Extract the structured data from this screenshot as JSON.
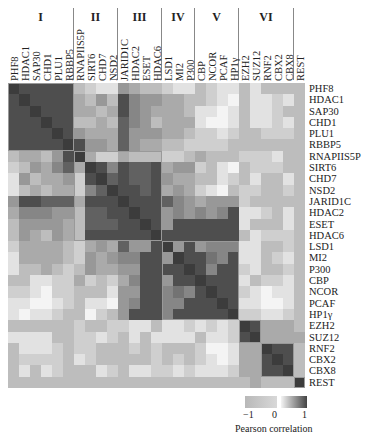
{
  "chart_data": {
    "type": "heatmap",
    "title": "",
    "colorbar_label": "Pearson correlation",
    "colorbar_ticks": [
      "−1",
      "0",
      "1"
    ],
    "colorscale": {
      "min": -1,
      "max": 1,
      "low_color": "#b8b8b8",
      "mid_color": "#f4f4f4",
      "high_color": "#3c3c3c"
    },
    "groups": [
      {
        "label": "I",
        "start": 0,
        "end": 5
      },
      {
        "label": "II",
        "start": 6,
        "end": 9
      },
      {
        "label": "III",
        "start": 10,
        "end": 13
      },
      {
        "label": "IV",
        "start": 14,
        "end": 16
      },
      {
        "label": "V",
        "start": 17,
        "end": 20
      },
      {
        "label": "VI",
        "start": 21,
        "end": 25
      }
    ],
    "labels": [
      "PHF8",
      "HDAC1",
      "SAP30",
      "CHD1",
      "PLU1",
      "RBBP5",
      "RNAPIIS5P",
      "SIRT6",
      "CHD7",
      "NSD2",
      "JARID1C",
      "HDAC2",
      "ESET",
      "HDAC6",
      "LSD1",
      "MI2",
      "P300",
      "CBP",
      "NCOR",
      "PCAF",
      "HP1γ",
      "EZH2",
      "SUZ12",
      "RNF2",
      "CBX2",
      "CBX8",
      "REST"
    ],
    "matrix": [
      [
        1,
        0.9,
        0.9,
        0.9,
        0.9,
        0.9,
        0.3,
        0.2,
        0.1,
        0.1,
        0.5,
        0.4,
        0.3,
        0.3,
        0.2,
        0.1,
        0.1,
        0.3,
        0.2,
        0.1,
        0.1,
        0.3,
        0.1,
        0.3,
        0.3,
        0.3,
        0.3
      ],
      [
        0.9,
        1,
        0.9,
        0.9,
        0.9,
        0.9,
        0.4,
        0.3,
        0.5,
        0.3,
        0.9,
        0.6,
        0.5,
        0.5,
        0.4,
        0.4,
        0.3,
        0.3,
        0.2,
        0.1,
        0,
        0.3,
        0.1,
        0.1,
        0.2,
        0.1,
        0.3
      ],
      [
        0.9,
        0.9,
        1,
        0.9,
        0.9,
        0.9,
        0.4,
        0.4,
        0.3,
        0.4,
        0.9,
        0.6,
        0.5,
        0.4,
        0.4,
        0.4,
        0.3,
        0.1,
        0.1,
        0,
        0.1,
        0.3,
        0.1,
        0.1,
        0.2,
        0.3,
        0.3
      ],
      [
        0.9,
        0.9,
        0.9,
        1,
        0.9,
        0.9,
        0.3,
        0.3,
        0.4,
        0.3,
        0.8,
        0.6,
        0.5,
        0.3,
        0.4,
        0.4,
        0.4,
        0.1,
        0,
        0,
        0.1,
        0.3,
        0.1,
        0.1,
        0.2,
        0.1,
        0.3
      ],
      [
        0.9,
        0.9,
        0.9,
        0.9,
        1,
        0.9,
        0.5,
        0.4,
        0.4,
        0.4,
        0.8,
        0.5,
        0.5,
        0.5,
        0.4,
        0.4,
        0.3,
        0.2,
        0.2,
        0.1,
        0.2,
        0.3,
        0.3,
        0.2,
        0.2,
        0.2,
        0.3
      ],
      [
        0.9,
        0.9,
        0.9,
        0.9,
        0.9,
        1,
        0.9,
        0.5,
        0.5,
        0.4,
        0.8,
        0.5,
        0.4,
        0.4,
        0.3,
        0.3,
        0.2,
        0.2,
        0.2,
        0.2,
        0.3,
        0.3,
        0.3,
        0.3,
        0.3,
        0.3,
        0.3
      ],
      [
        0.3,
        0.4,
        0.4,
        0.3,
        0.5,
        0.9,
        1,
        0.4,
        0.2,
        0.2,
        0.4,
        0.3,
        0.3,
        0.3,
        0.2,
        0.2,
        0.3,
        0.4,
        0.3,
        0.3,
        0.3,
        0.2,
        0.2,
        0.2,
        0.1,
        0.3,
        0.3
      ],
      [
        0.2,
        0.3,
        0.5,
        0.4,
        0.6,
        0.8,
        0.4,
        1,
        0.9,
        0.6,
        0.9,
        0.8,
        0.8,
        0.9,
        0.4,
        0.5,
        0.5,
        0.2,
        0.3,
        0.1,
        0,
        0.3,
        0.2,
        0.2,
        0.2,
        0.3,
        0.3
      ],
      [
        0.1,
        0.5,
        0.3,
        0.4,
        0.4,
        0.5,
        0.2,
        0.9,
        1,
        0.8,
        0.9,
        0.8,
        0.8,
        0.9,
        0.5,
        0.4,
        0.4,
        0.3,
        0.3,
        0.1,
        0.2,
        0.3,
        0.1,
        0.3,
        0.3,
        0.1,
        0.3
      ],
      [
        0.1,
        0.3,
        0.4,
        0.3,
        0.4,
        0.4,
        0.2,
        0.6,
        0.8,
        1,
        0.9,
        0.9,
        0.8,
        0.9,
        0.4,
        0.5,
        0.4,
        0.2,
        0.1,
        0,
        0.3,
        0.2,
        0.2,
        0.3,
        0.3,
        0.2,
        0.3
      ],
      [
        0.5,
        0.9,
        0.9,
        0.8,
        0.8,
        0.8,
        0.4,
        0.9,
        0.9,
        0.9,
        1,
        0.9,
        0.9,
        0.9,
        0.8,
        0.6,
        0.5,
        0.4,
        0.5,
        0.5,
        0.5,
        0.2,
        0.3,
        0.3,
        0.3,
        0.3,
        0.3
      ],
      [
        0.4,
        0.6,
        0.6,
        0.6,
        0.5,
        0.5,
        0.3,
        0.8,
        0.8,
        0.9,
        0.9,
        1,
        0.9,
        0.9,
        0.5,
        0.6,
        0.5,
        0.6,
        0.5,
        0.6,
        0.9,
        0.1,
        0.1,
        0.2,
        0.3,
        0.1,
        0.3
      ],
      [
        0.3,
        0.5,
        0.5,
        0.5,
        0.5,
        0.4,
        0.3,
        0.8,
        0.8,
        0.8,
        0.9,
        0.9,
        1,
        0.9,
        0.5,
        0.9,
        0.9,
        0.9,
        0.9,
        0.9,
        0.9,
        0.1,
        0.3,
        0.3,
        0.3,
        0.1,
        0.3
      ],
      [
        0.3,
        0.5,
        0.4,
        0.3,
        0.5,
        0.4,
        0.3,
        0.9,
        0.9,
        0.9,
        0.9,
        0.9,
        0.9,
        1,
        0.9,
        0.9,
        0.9,
        0.9,
        0.9,
        0.9,
        0.9,
        0.3,
        0.1,
        0.2,
        0.2,
        0.2,
        0.3
      ],
      [
        0.2,
        0.4,
        0.4,
        0.4,
        0.4,
        0.3,
        0.2,
        0.4,
        0.5,
        0.4,
        0.8,
        0.5,
        0.5,
        0.9,
        1,
        0.5,
        0.9,
        0.5,
        0.6,
        0.6,
        0.6,
        0.1,
        0.1,
        0.3,
        0.3,
        0.2,
        0.3
      ],
      [
        0.1,
        0.4,
        0.4,
        0.4,
        0.4,
        0.3,
        0.2,
        0.5,
        0.4,
        0.5,
        0.6,
        0.6,
        0.9,
        0.9,
        0.5,
        1,
        0.9,
        0.9,
        0.7,
        0.6,
        0.9,
        0.1,
        0.1,
        0.3,
        0.2,
        0.1,
        0.3
      ],
      [
        0.1,
        0.3,
        0.3,
        0.4,
        0.3,
        0.2,
        0.3,
        0.5,
        0.4,
        0.4,
        0.5,
        0.5,
        0.9,
        0.9,
        0.9,
        0.9,
        1,
        0.9,
        0.6,
        0.9,
        0.9,
        0.2,
        0.1,
        0.3,
        0.3,
        0.2,
        0.3
      ],
      [
        0.3,
        0.3,
        0.1,
        0.1,
        0.2,
        0.2,
        0.4,
        0.2,
        0.3,
        0.2,
        0.4,
        0.6,
        0.9,
        0.9,
        0.5,
        0.9,
        0.9,
        1,
        0.9,
        0.9,
        0.9,
        0.1,
        0.3,
        0.2,
        0.2,
        0.1,
        0.3
      ],
      [
        0.2,
        0.2,
        0.1,
        0,
        0.2,
        0.2,
        0.3,
        0.3,
        0.3,
        0.1,
        0.5,
        0.5,
        0.9,
        0.9,
        0.6,
        0.7,
        0.6,
        0.9,
        1,
        0.9,
        0.9,
        0.2,
        0.1,
        0,
        0.1,
        0.1,
        0.3
      ],
      [
        0.1,
        0.1,
        0,
        0,
        0.1,
        0.2,
        0.3,
        0.1,
        0.1,
        0,
        0.5,
        0.6,
        0.9,
        0.9,
        0.6,
        0.6,
        0.9,
        0.9,
        0.9,
        1,
        0.9,
        0.1,
        0.1,
        0,
        0,
        0.1,
        0.3
      ],
      [
        0.1,
        0,
        0.1,
        0.1,
        0.2,
        0.3,
        0.3,
        0,
        0.2,
        0.3,
        0.5,
        0.9,
        0.9,
        0.9,
        0.6,
        0.9,
        0.9,
        0.9,
        0.9,
        0.9,
        1,
        0.2,
        0.2,
        0.1,
        0.1,
        0.2,
        0.3
      ],
      [
        0.3,
        0.3,
        0.3,
        0.3,
        0.3,
        0.3,
        0.2,
        0.3,
        0.3,
        0.2,
        0.2,
        0.1,
        0.1,
        0.3,
        0.1,
        0.1,
        0.2,
        0.1,
        0.2,
        0.1,
        0.2,
        1,
        0.9,
        0.4,
        0.4,
        0.4,
        0.3
      ],
      [
        0.1,
        0.1,
        0.1,
        0.1,
        0.3,
        0.3,
        0.2,
        0.2,
        0.1,
        0.2,
        0.3,
        0.1,
        0.3,
        0.1,
        0.1,
        0.1,
        0.1,
        0.3,
        0.1,
        0.1,
        0.2,
        0.9,
        1,
        0.4,
        0.4,
        0.4,
        0.4
      ],
      [
        0.3,
        0.1,
        0.1,
        0.1,
        0.2,
        0.3,
        0.2,
        0.2,
        0.3,
        0.3,
        0.3,
        0.2,
        0.3,
        0.2,
        0.3,
        0.3,
        0.3,
        0.2,
        0,
        0,
        0.1,
        0.4,
        0.4,
        1,
        0.9,
        0.9,
        0.3
      ],
      [
        0.3,
        0.2,
        0.2,
        0.2,
        0.2,
        0.3,
        0.1,
        0.2,
        0.3,
        0.3,
        0.3,
        0.3,
        0.3,
        0.2,
        0.3,
        0.2,
        0.3,
        0.2,
        0.1,
        0,
        0.1,
        0.4,
        0.4,
        0.9,
        1,
        0.9,
        0.3
      ],
      [
        0.3,
        0.1,
        0.3,
        0.1,
        0.2,
        0.3,
        0.3,
        0.3,
        0.1,
        0.2,
        0.3,
        0.1,
        0.1,
        0.2,
        0.2,
        0.1,
        0.2,
        0.1,
        0.1,
        0.1,
        0.2,
        0.4,
        0.4,
        0.9,
        0.9,
        1,
        0.3
      ],
      [
        0.3,
        0.3,
        0.3,
        0.3,
        0.3,
        0.3,
        0.3,
        0.3,
        0.3,
        0.3,
        0.3,
        0.3,
        0.3,
        0.3,
        0.3,
        0.3,
        0.3,
        0.3,
        0.3,
        0.3,
        0.3,
        0.3,
        0.4,
        0.3,
        0.3,
        0.3,
        1
      ]
    ],
    "highlight_blocks": [
      {
        "start": 0,
        "end": 5
      },
      {
        "start": 6,
        "end": 13
      },
      {
        "start": 14,
        "end": 20
      },
      {
        "start": 21,
        "end": 22
      },
      {
        "start": 23,
        "end": 25
      },
      {
        "start": 26,
        "end": 26
      }
    ],
    "legend_position": "bottom-right",
    "grid": false
  }
}
